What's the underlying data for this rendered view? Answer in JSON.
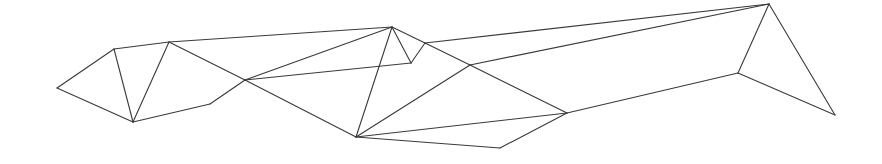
{
  "diagram": {
    "type": "line-mesh",
    "stroke_color": "#3a3a3a",
    "background": "#ffffff",
    "nodes": {
      "A": [
        57,
        88
      ],
      "B": [
        114,
        49
      ],
      "C": [
        169,
        42
      ],
      "D": [
        133,
        122
      ],
      "E": [
        210,
        104
      ],
      "F": [
        245,
        80
      ],
      "G": [
        392,
        27
      ],
      "H": [
        411,
        63
      ],
      "I": [
        425,
        43
      ],
      "J": [
        356,
        137
      ],
      "K": [
        470,
        65
      ],
      "L": [
        567,
        113
      ],
      "M": [
        500,
        148
      ],
      "N": [
        769,
        4
      ],
      "O": [
        738,
        73
      ],
      "P": [
        835,
        115
      ]
    },
    "edges": [
      [
        "A",
        "B"
      ],
      [
        "B",
        "C"
      ],
      [
        "A",
        "D"
      ],
      [
        "B",
        "D"
      ],
      [
        "C",
        "D"
      ],
      [
        "D",
        "E"
      ],
      [
        "E",
        "F"
      ],
      [
        "C",
        "G"
      ],
      [
        "C",
        "F"
      ],
      [
        "F",
        "G"
      ],
      [
        "F",
        "H"
      ],
      [
        "G",
        "H"
      ],
      [
        "H",
        "I"
      ],
      [
        "G",
        "J"
      ],
      [
        "G",
        "I"
      ],
      [
        "I",
        "K"
      ],
      [
        "F",
        "J"
      ],
      [
        "K",
        "L"
      ],
      [
        "J",
        "K"
      ],
      [
        "J",
        "L"
      ],
      [
        "J",
        "M"
      ],
      [
        "M",
        "L"
      ],
      [
        "I",
        "N"
      ],
      [
        "K",
        "N"
      ],
      [
        "L",
        "O"
      ],
      [
        "O",
        "N"
      ],
      [
        "O",
        "P"
      ],
      [
        "N",
        "P"
      ]
    ]
  }
}
